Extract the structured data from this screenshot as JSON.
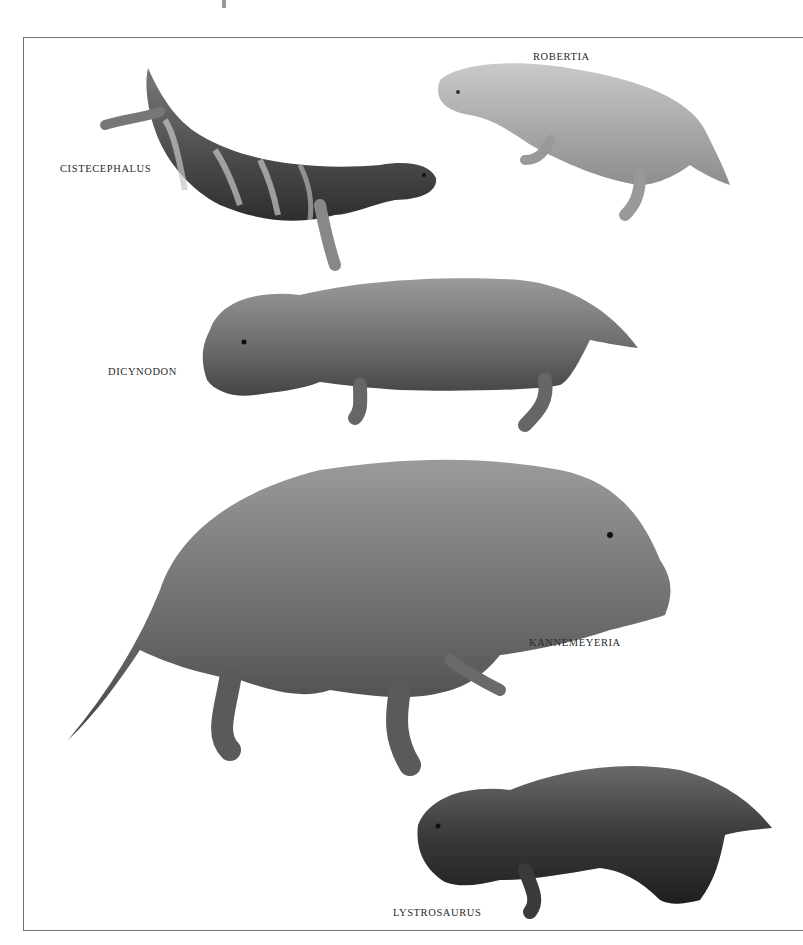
{
  "page": {
    "type": "illustrated book plate",
    "background": "#ffffff",
    "frame_color": "#6f6f6f"
  },
  "labels": {
    "cistecephalus": "CISTECEPHALUS",
    "robertia": "ROBERTIA",
    "dicynodon": "DICYNODON",
    "kannemeyeria": "KANNEMEYERIA",
    "lystrosaurus": "LYSTROSAURUS"
  },
  "illustrations": [
    {
      "name": "Cistecephalus",
      "tone": "dark banded grey"
    },
    {
      "name": "Robertia",
      "tone": "light grey"
    },
    {
      "name": "Dicynodon",
      "tone": "medium grey"
    },
    {
      "name": "Kannemeyeria",
      "tone": "medium-dark grey"
    },
    {
      "name": "Lystrosaurus",
      "tone": "dark grey"
    }
  ]
}
